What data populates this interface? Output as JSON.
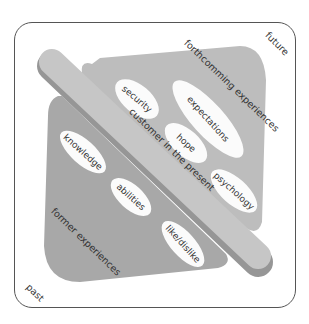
{
  "diagram": {
    "corners": {
      "future": "future",
      "past": "past"
    },
    "regions": {
      "upper": {
        "label": "forthcomming experiences",
        "color": "#bdbdbd"
      },
      "lower": {
        "label": "former experiences",
        "color": "#a8a8a8"
      },
      "band": {
        "label": "customer in the present",
        "color": "#c6c6c6",
        "shadow": "#969696"
      }
    },
    "upper_items": [
      "security",
      "expectations",
      "hope",
      "psychology"
    ],
    "lower_items": [
      "knowledge",
      "abilities",
      "like/dislike"
    ],
    "colors": {
      "frame": "#555555",
      "oval": "#fbfbfb",
      "text": "#333333"
    }
  }
}
